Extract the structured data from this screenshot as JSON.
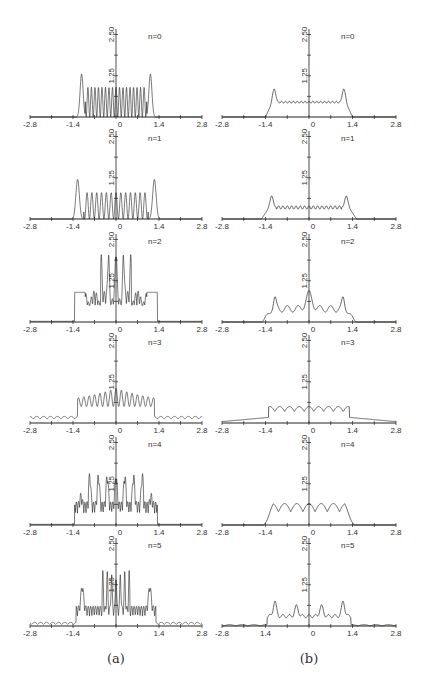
{
  "figure": {
    "captions": [
      "(a)",
      "(b)"
    ],
    "x_ticks": [
      "-2.8",
      "-1.4",
      "0",
      "1.4",
      "2.8"
    ],
    "x_ticks_b_last": [
      "-2.8",
      "1.4",
      "0",
      "1.4",
      "2.8"
    ],
    "y_ticks": [
      "1.25",
      "2.50"
    ],
    "panel_labels": [
      "n=0",
      "n=1",
      "n=2",
      "n=3",
      "n=4",
      "n=5"
    ],
    "line_color": "#222222"
  },
  "chart_data": [
    {
      "type": "line",
      "column": "a",
      "title": "n=0",
      "xlim": [
        -2.8,
        2.8
      ],
      "ylim": [
        0,
        2.5
      ],
      "description": "Rapid oscillations between ~0 and ~0.9 across |x|<1.2, sharp edge peaks ~1.3 near x=±1.1, zero outside ±1.3"
    },
    {
      "type": "line",
      "column": "a",
      "title": "n=1",
      "xlim": [
        -2.8,
        2.8
      ],
      "ylim": [
        0,
        2.5
      ],
      "description": "Oscillations 0 to ~0.8 across |x|<1.1, edge peaks ~1.2 near x=±1.25"
    },
    {
      "type": "line",
      "column": "a",
      "title": "n=2",
      "xlim": [
        -2.8,
        2.8
      ],
      "ylim": [
        0,
        2.5
      ],
      "description": "Dense irregular oscillations, central spikes up to ~2.3, edge shoulders ~1.0 near x=±1.1"
    },
    {
      "type": "line",
      "column": "a",
      "title": "n=3",
      "xlim": [
        -2.8,
        2.8
      ],
      "ylim": [
        0,
        2.5
      ],
      "description": "Central oscillations up to ~1.2, small ripples ~0.2 extending to ±2.7"
    },
    {
      "type": "line",
      "column": "a",
      "title": "n=4",
      "xlim": [
        -2.8,
        2.8
      ],
      "ylim": [
        0,
        2.5
      ],
      "description": "Dense oscillations peaks ~1.4 near center, shoulders ~0.7 to ±1.3"
    },
    {
      "type": "line",
      "column": "a",
      "title": "n=5",
      "xlim": [
        -2.8,
        2.8
      ],
      "ylim": [
        0,
        2.5
      ],
      "description": "Central spikes ~1.6, side peaks ~1.0 near ±1.1, small ripples to ±2.7"
    },
    {
      "type": "line",
      "column": "b",
      "title": "n=0",
      "xlim": [
        -2.8,
        2.8
      ],
      "ylim": [
        0,
        2.5
      ],
      "description": "Flat plateau ~0.45 with small ripple across |x|<1.0, edge peaks ~0.85 near ±1.1"
    },
    {
      "type": "line",
      "column": "b",
      "title": "n=1",
      "xlim": [
        -2.8,
        2.8
      ],
      "ylim": [
        0,
        2.5
      ],
      "description": "Plateau ~0.35 with ripples, edge peaks ~0.7 near ±1.2"
    },
    {
      "type": "line",
      "column": "b",
      "title": "n=2",
      "xlim": [
        -2.8,
        2.8
      ],
      "ylim": [
        0,
        2.5
      ],
      "description": "Edge peaks ~0.65 near ±1.1, central peak ~0.85, mid level ~0.4"
    },
    {
      "type": "line",
      "column": "b",
      "title": "n=3",
      "xlim": [
        -2.8,
        2.8
      ],
      "ylim": [
        0,
        2.5
      ],
      "description": "Broad bumpy profile ~0.5 in center, low ~0.1 plateau to ±2.6"
    },
    {
      "type": "line",
      "column": "b",
      "title": "n=4",
      "xlim": [
        -2.8,
        2.8
      ],
      "ylim": [
        0,
        2.5
      ],
      "description": "Bumpy profile peaks ~0.7 around ±0.5, zero beyond ±1.4"
    },
    {
      "type": "line",
      "column": "b",
      "title": "n=5",
      "xlim": [
        -2.8,
        2.8
      ],
      "ylim": [
        0,
        2.5
      ],
      "description": "Peaks ~0.75 near ±1.1 and ±0.4, mid ~0.3, tiny tails to ±2.7"
    }
  ]
}
